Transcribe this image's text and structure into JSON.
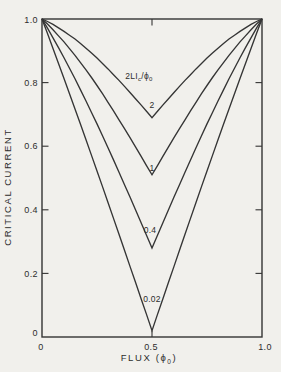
{
  "figure": {
    "description_labels": {
      "y_axis_title": "CRITICAL CURRENT",
      "x_axis_title_parts": [
        "FLUX  (ϕ",
        "0",
        ")"
      ]
    }
  },
  "chart_data": {
    "type": "line",
    "title": "",
    "xlabel_parts": [
      "FLUX  (ϕ",
      "0",
      ")"
    ],
    "ylabel": "CRITICAL CURRENT",
    "xlim": [
      0,
      1
    ],
    "ylim": [
      0,
      1
    ],
    "grid": false,
    "legend_position": "none",
    "x_ticks": [
      {
        "v": 0,
        "label": "0"
      },
      {
        "v": 0.5,
        "label": "0.5"
      },
      {
        "v": 1.0,
        "label": "1.0"
      }
    ],
    "y_ticks": [
      {
        "v": 1.0,
        "label": "1.0"
      },
      {
        "v": 0.8,
        "label": "0.8"
      },
      {
        "v": 0.6,
        "label": "0.6"
      },
      {
        "v": 0.4,
        "label": "0.4"
      },
      {
        "v": 0.2,
        "label": "0.2"
      },
      {
        "v": 0,
        "label": "0"
      }
    ],
    "annotation": {
      "parts": [
        "2LI",
        "c",
        "/ϕ",
        "0"
      ],
      "x": 0.44,
      "y": 0.82
    },
    "series": [
      {
        "name": "2",
        "beta": 2,
        "min_value": 0.69,
        "points_half": [
          [
            0,
            1
          ],
          [
            0.025,
            0.992
          ],
          [
            0.05,
            0.983
          ],
          [
            0.075,
            0.972
          ],
          [
            0.1,
            0.961
          ],
          [
            0.125,
            0.949
          ],
          [
            0.15,
            0.937
          ],
          [
            0.175,
            0.923
          ],
          [
            0.2,
            0.908
          ],
          [
            0.225,
            0.893
          ],
          [
            0.25,
            0.877
          ],
          [
            0.275,
            0.86
          ],
          [
            0.3,
            0.843
          ],
          [
            0.325,
            0.825
          ],
          [
            0.35,
            0.807
          ],
          [
            0.375,
            0.788
          ],
          [
            0.4,
            0.769
          ],
          [
            0.425,
            0.749
          ],
          [
            0.45,
            0.73
          ],
          [
            0.475,
            0.71
          ],
          [
            0.5,
            0.69
          ]
        ]
      },
      {
        "name": "1",
        "beta": 1,
        "min_value": 0.51,
        "points_half": [
          [
            0,
            1
          ],
          [
            0.025,
            0.984
          ],
          [
            0.05,
            0.966
          ],
          [
            0.075,
            0.947
          ],
          [
            0.1,
            0.928
          ],
          [
            0.125,
            0.907
          ],
          [
            0.15,
            0.886
          ],
          [
            0.175,
            0.863
          ],
          [
            0.2,
            0.84
          ],
          [
            0.225,
            0.816
          ],
          [
            0.25,
            0.791
          ],
          [
            0.275,
            0.765
          ],
          [
            0.3,
            0.738
          ],
          [
            0.325,
            0.711
          ],
          [
            0.35,
            0.683
          ],
          [
            0.375,
            0.655
          ],
          [
            0.4,
            0.627
          ],
          [
            0.425,
            0.598
          ],
          [
            0.45,
            0.569
          ],
          [
            0.475,
            0.539
          ],
          [
            0.5,
            0.51
          ]
        ]
      },
      {
        "name": "0.4",
        "beta": 0.4,
        "min_value": 0.28,
        "points_half": [
          [
            0,
            1
          ],
          [
            0.025,
            0.971
          ],
          [
            0.05,
            0.941
          ],
          [
            0.075,
            0.91
          ],
          [
            0.1,
            0.878
          ],
          [
            0.125,
            0.845
          ],
          [
            0.15,
            0.812
          ],
          [
            0.175,
            0.777
          ],
          [
            0.2,
            0.742
          ],
          [
            0.225,
            0.706
          ],
          [
            0.25,
            0.67
          ],
          [
            0.275,
            0.633
          ],
          [
            0.3,
            0.595
          ],
          [
            0.325,
            0.557
          ],
          [
            0.35,
            0.518
          ],
          [
            0.375,
            0.479
          ],
          [
            0.4,
            0.44
          ],
          [
            0.425,
            0.4
          ],
          [
            0.45,
            0.36
          ],
          [
            0.475,
            0.32
          ],
          [
            0.5,
            0.28
          ]
        ]
      },
      {
        "name": "0.02",
        "beta": 0.02,
        "min_value": 0.02,
        "points_half": [
          [
            0,
            1
          ],
          [
            0.025,
            0.954
          ],
          [
            0.05,
            0.907
          ],
          [
            0.075,
            0.86
          ],
          [
            0.1,
            0.813
          ],
          [
            0.125,
            0.765
          ],
          [
            0.15,
            0.717
          ],
          [
            0.175,
            0.669
          ],
          [
            0.2,
            0.62
          ],
          [
            0.225,
            0.571
          ],
          [
            0.25,
            0.522
          ],
          [
            0.275,
            0.473
          ],
          [
            0.3,
            0.423
          ],
          [
            0.325,
            0.373
          ],
          [
            0.35,
            0.323
          ],
          [
            0.375,
            0.273
          ],
          [
            0.4,
            0.222
          ],
          [
            0.425,
            0.172
          ],
          [
            0.45,
            0.121
          ],
          [
            0.475,
            0.071
          ],
          [
            0.5,
            0.02
          ]
        ]
      }
    ],
    "colors": {
      "line": "#353535",
      "text": "#2d2d2d",
      "background": "#f1f0ec",
      "border": "#343434"
    }
  }
}
